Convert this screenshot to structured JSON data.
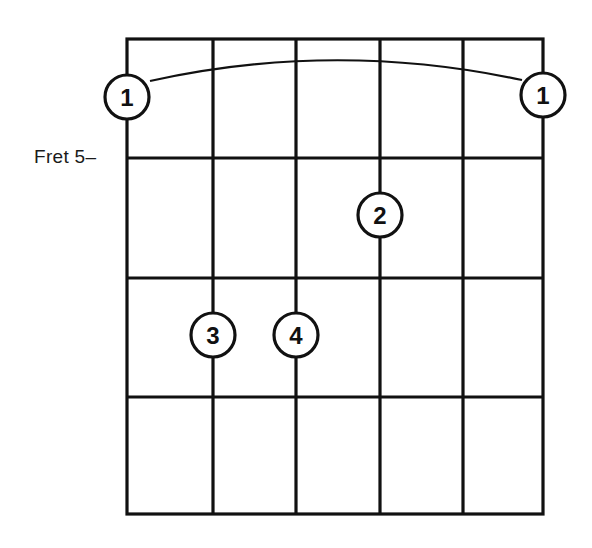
{
  "diagram": {
    "type": "guitar-chord-diagram",
    "fret_label": "Fret 5–",
    "strings": 6,
    "frets_shown": 4,
    "barre": {
      "finger": "1",
      "from_string": 1,
      "to_string": 6
    },
    "fingers": [
      {
        "label": "1",
        "string": 1,
        "position": "barre-left"
      },
      {
        "label": "1",
        "string": 6,
        "position": "barre-right"
      },
      {
        "label": "2",
        "string": 4,
        "fret_row": 2
      },
      {
        "label": "3",
        "string": 2,
        "fret_row": 3
      },
      {
        "label": "4",
        "string": 3,
        "fret_row": 3
      }
    ],
    "colors": {
      "line": "#111111",
      "background": "#ffffff"
    }
  }
}
